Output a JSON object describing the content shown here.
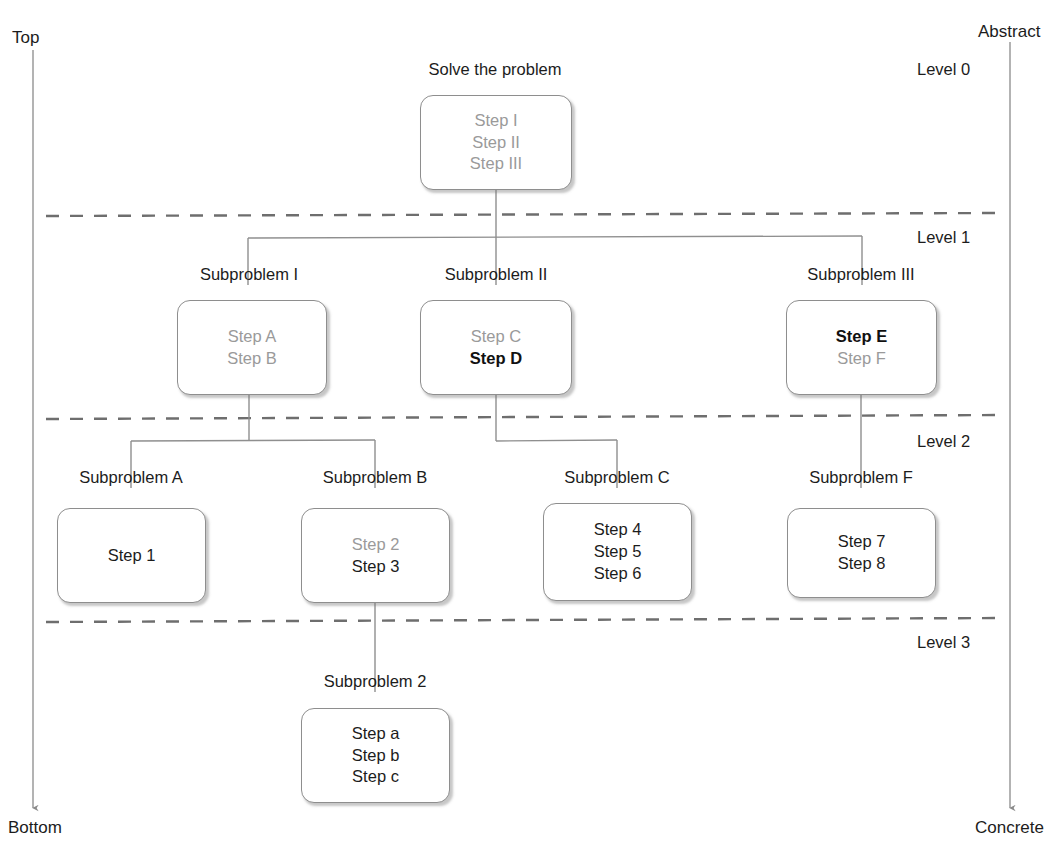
{
  "diagram": {
    "title_note": "Hierarchical problem decomposition diagram",
    "axis": {
      "left_top": "Top",
      "left_bottom": "Bottom",
      "right_top": "Abstract",
      "right_bottom": "Concrete"
    },
    "level_labels": [
      {
        "text": "Level 0",
        "x": 917,
        "y": 60
      },
      {
        "text": "Level 1",
        "x": 917,
        "y": 228
      },
      {
        "text": "Level 2",
        "x": 917,
        "y": 432
      },
      {
        "text": "Level 3",
        "x": 917,
        "y": 633
      }
    ],
    "dividers": [
      {
        "name": "divider-level-0-1",
        "y": 215
      },
      {
        "name": "divider-level-1-2",
        "y": 417
      },
      {
        "name": "divider-level-2-3",
        "y": 620
      }
    ],
    "nodes": [
      {
        "id": "root",
        "name": "node-solve-the-problem",
        "label": "Solve the problem",
        "label_x": 495,
        "label_y": 60,
        "x": 420,
        "y": 95,
        "w": 152,
        "h": 95,
        "steps": [
          {
            "text": "Step I",
            "style": "gray"
          },
          {
            "text": "Step II",
            "style": "gray"
          },
          {
            "text": "Step III",
            "style": "gray"
          }
        ]
      },
      {
        "id": "sub1",
        "name": "node-subproblem-i",
        "label": "Subproblem I",
        "label_x": 249,
        "label_y": 265,
        "x": 177,
        "y": 300,
        "w": 150,
        "h": 95,
        "steps": [
          {
            "text": "Step A",
            "style": "gray"
          },
          {
            "text": "Step B",
            "style": "gray"
          }
        ]
      },
      {
        "id": "sub2",
        "name": "node-subproblem-ii",
        "label": "Subproblem II",
        "label_x": 496,
        "label_y": 265,
        "x": 420,
        "y": 300,
        "w": 152,
        "h": 95,
        "steps": [
          {
            "text": "Step C",
            "style": "gray"
          },
          {
            "text": "Step D",
            "style": "bold"
          }
        ]
      },
      {
        "id": "sub3",
        "name": "node-subproblem-iii",
        "label": "Subproblem III",
        "label_x": 861,
        "label_y": 265,
        "x": 786,
        "y": 300,
        "w": 151,
        "h": 95,
        "steps": [
          {
            "text": "Step E",
            "style": "bold"
          },
          {
            "text": "Step F",
            "style": "gray"
          }
        ]
      },
      {
        "id": "subA",
        "name": "node-subproblem-a",
        "label": "Subproblem A",
        "label_x": 131,
        "label_y": 468,
        "x": 57,
        "y": 508,
        "w": 149,
        "h": 95,
        "steps": [
          {
            "text": "Step 1",
            "style": "dark"
          }
        ]
      },
      {
        "id": "subB",
        "name": "node-subproblem-b",
        "label": "Subproblem B",
        "label_x": 375,
        "label_y": 468,
        "x": 301,
        "y": 508,
        "w": 149,
        "h": 95,
        "steps": [
          {
            "text": "Step 2",
            "style": "gray"
          },
          {
            "text": "Step 3",
            "style": "dark"
          }
        ]
      },
      {
        "id": "subC",
        "name": "node-subproblem-c",
        "label": "Subproblem C",
        "label_x": 617,
        "label_y": 468,
        "x": 543,
        "y": 503,
        "w": 149,
        "h": 98,
        "steps": [
          {
            "text": "Step 4",
            "style": "dark"
          },
          {
            "text": "Step 5",
            "style": "dark"
          },
          {
            "text": "Step 6",
            "style": "dark"
          }
        ]
      },
      {
        "id": "subF",
        "name": "node-subproblem-f",
        "label": "Subproblem F",
        "label_x": 861,
        "label_y": 468,
        "x": 787,
        "y": 508,
        "w": 149,
        "h": 90,
        "steps": [
          {
            "text": "Step 7",
            "style": "dark"
          },
          {
            "text": "Step 8",
            "style": "dark"
          }
        ]
      },
      {
        "id": "sub2num",
        "name": "node-subproblem-2",
        "label": "Subproblem 2",
        "label_x": 375,
        "label_y": 672,
        "x": 301,
        "y": 708,
        "w": 149,
        "h": 95,
        "steps": [
          {
            "text": "Step a",
            "style": "dark"
          },
          {
            "text": "Step b",
            "style": "dark"
          },
          {
            "text": "Step c",
            "style": "dark"
          }
        ]
      }
    ],
    "connectors": {
      "root_to_level1": {
        "parent_x": 496,
        "bar_y": 238,
        "left_x": 248,
        "right_x": 862
      },
      "sub1_to_level2": {
        "parent_x": 249,
        "bar_y": 440,
        "left_x": 131,
        "right_x": 375
      },
      "sub2_to_level2": {
        "parent_x": 496,
        "bar_y": 440,
        "left_x": 496,
        "right_x": 617
      },
      "sub3_to_subF": {
        "parent_x": 861
      },
      "subB_to_sub2": {
        "parent_x": 375
      }
    }
  }
}
